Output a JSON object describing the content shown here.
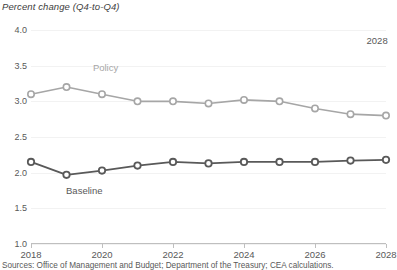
{
  "chart_data": {
    "type": "line",
    "title": "Percent change (Q4-to-Q4)",
    "xlabel": "",
    "ylabel": "Percent change (Q4-to-Q4)",
    "x": [
      2018,
      2019,
      2020,
      2021,
      2022,
      2023,
      2024,
      2025,
      2026,
      2027,
      2028
    ],
    "xlim": [
      2018,
      2028
    ],
    "ylim": [
      1.0,
      4.0
    ],
    "ytick_labels": [
      "1.0",
      "1.5",
      "2.0",
      "2.5",
      "3.0",
      "3.5",
      "4.0"
    ],
    "ytick_values": [
      1.0,
      1.5,
      2.0,
      2.5,
      3.0,
      3.5,
      4.0
    ],
    "xtick_labels": [
      "2018",
      "2020",
      "2022",
      "2024",
      "2026",
      "2028"
    ],
    "xtick_values": [
      2018,
      2020,
      2022,
      2024,
      2026,
      2028
    ],
    "grid": true,
    "legend_position": "inline-labels",
    "series": [
      {
        "name": "Policy",
        "color": "#a6a6a6",
        "marker": "open-circle",
        "label_x": 2020.1,
        "label_y": 3.48,
        "values": [
          3.1,
          3.2,
          3.1,
          3.0,
          3.0,
          2.97,
          3.02,
          3.0,
          2.9,
          2.82,
          2.8
        ]
      },
      {
        "name": "Baseline",
        "color": "#595959",
        "marker": "open-circle",
        "label_x": 2019.5,
        "label_y": 1.76,
        "values": [
          2.15,
          1.97,
          2.03,
          2.1,
          2.15,
          2.13,
          2.15,
          2.15,
          2.15,
          2.17,
          2.18
        ]
      }
    ],
    "annotations": [
      {
        "text": "2028",
        "x": 2027.75,
        "y": 3.86
      }
    ],
    "source": "Sources: Office of Management and Budget; Department of the Treasury; CEA calculations."
  }
}
